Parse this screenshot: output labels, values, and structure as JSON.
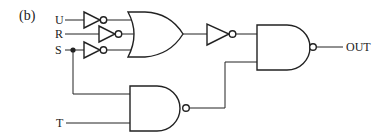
{
  "figure": {
    "panel_label": "(b)",
    "inputs": [
      {
        "name": "U",
        "label": "U"
      },
      {
        "name": "R",
        "label": "R"
      },
      {
        "name": "S",
        "label": "S"
      },
      {
        "name": "T",
        "label": "T"
      }
    ],
    "output": {
      "label": "OUT"
    },
    "gates": [
      {
        "id": "not-u",
        "type": "NOT",
        "input": "U"
      },
      {
        "id": "not-r",
        "type": "NOT",
        "input": "R"
      },
      {
        "id": "not-s",
        "type": "NOT",
        "input": "S"
      },
      {
        "id": "or1",
        "type": "OR",
        "inputs": [
          "not-u",
          "not-r",
          "not-s"
        ]
      },
      {
        "id": "not-or",
        "type": "NOT",
        "input": "or1"
      },
      {
        "id": "nand-low",
        "type": "NAND",
        "inputs": [
          "S",
          "T"
        ]
      },
      {
        "id": "nand-out",
        "type": "NAND",
        "inputs": [
          "not-or",
          "nand-low"
        ]
      }
    ]
  }
}
